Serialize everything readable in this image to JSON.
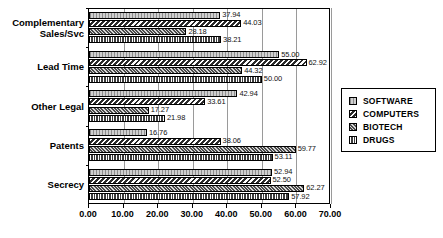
{
  "chart_data": {
    "type": "bar",
    "orientation": "horizontal",
    "title": "",
    "xlabel": "",
    "ylabel": "",
    "xlim": [
      0,
      70
    ],
    "xticks": [
      "0.00",
      "10.00",
      "20.00",
      "30.00",
      "40.00",
      "50.00",
      "60.00",
      "70.00"
    ],
    "xtick_values": [
      0,
      10,
      20,
      30,
      40,
      50,
      60,
      70
    ],
    "grid": true,
    "legend_position": "right",
    "categories": [
      "Complementary Sales/Svc",
      "Lead Time",
      "Other Legal",
      "Patents",
      "Secrecy"
    ],
    "category_lines": [
      [
        "Complementary",
        "Sales/Svc"
      ],
      [
        "Lead Time"
      ],
      [
        "Other Legal"
      ],
      [
        "Patents"
      ],
      [
        "Secrecy"
      ]
    ],
    "series": [
      {
        "name": "SOFTWARE",
        "pattern": "light-vertical-hatch",
        "values": [
          37.94,
          55.0,
          42.94,
          16.76,
          52.94
        ],
        "labels": [
          "37.94",
          "55.00",
          "42.94",
          "16.76",
          "52.94"
        ]
      },
      {
        "name": "COMPUTERS",
        "pattern": "dark-diagonal-hatch",
        "values": [
          44.03,
          62.92,
          33.61,
          38.06,
          52.5
        ],
        "labels": [
          "44.03",
          "62.92",
          "33.61",
          "38.06",
          "52.50"
        ]
      },
      {
        "name": "BIOTECH",
        "pattern": "dark-crosshatch",
        "values": [
          28.18,
          44.32,
          17.27,
          59.77,
          62.27
        ],
        "labels": [
          "28.18",
          "44.32",
          "17.27",
          "59.77",
          "62.27"
        ]
      },
      {
        "name": "DRUGS",
        "pattern": "dark-grid",
        "values": [
          38.21,
          50.0,
          21.98,
          53.11,
          57.92
        ],
        "labels": [
          "38.21",
          "50.00",
          "21.98",
          "53.11",
          "57.92"
        ]
      }
    ]
  },
  "legend": {
    "items": [
      {
        "label": "SOFTWARE"
      },
      {
        "label": "COMPUTERS"
      },
      {
        "label": "BIOTECH"
      },
      {
        "label": "DRUGS"
      }
    ]
  },
  "colors": {
    "axis": "#000000",
    "gridline": "#9a9a9a",
    "background": "#ffffff",
    "text": "#000000"
  }
}
